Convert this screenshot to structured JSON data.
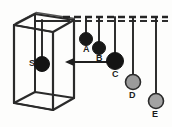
{
  "figure": {
    "background_color": "#fdfdfc",
    "stroke_color": "#232323",
    "width": 172,
    "height": 127
  },
  "rail": {
    "name": "support-rail",
    "style": "dashed",
    "y": 17,
    "x_start": 63,
    "x_end": 168,
    "color": "#252525"
  },
  "box": {
    "name": "wireframe-box",
    "color": "#2a2a2a",
    "description": "open wireframe rectangular box drawn in perspective"
  },
  "arrow": {
    "name": "direction-arrow",
    "direction": "left",
    "x_tail": 108,
    "x_head": 66,
    "y": 62,
    "color": "#1f1f1f"
  },
  "balls": [
    {
      "id": "S",
      "label": "S",
      "cx": 42,
      "cy": 64,
      "r": 7.5,
      "fill": "#141414",
      "stroke": "#141414",
      "string_top_y": 20,
      "label_x": 29,
      "label_y": 60,
      "location": "inside-box"
    },
    {
      "id": "A",
      "label": "A",
      "cx": 86,
      "cy": 39,
      "r": 6.5,
      "fill": "#181818",
      "stroke": "#181818",
      "string_top_y": 17,
      "label_x": 83,
      "label_y": 47,
      "location": "pendulum-row"
    },
    {
      "id": "B",
      "label": "B",
      "cx": 99,
      "cy": 48,
      "r": 6.5,
      "fill": "#181818",
      "stroke": "#181818",
      "string_top_y": 17,
      "label_x": 96,
      "label_y": 56,
      "location": "pendulum-row"
    },
    {
      "id": "C",
      "label": "C",
      "cx": 115,
      "cy": 61,
      "r": 8.5,
      "fill": "#141414",
      "stroke": "#141414",
      "string_top_y": 17,
      "label_x": 112,
      "label_y": 71,
      "location": "pendulum-row"
    },
    {
      "id": "D",
      "label": "D",
      "cx": 133,
      "cy": 82,
      "r": 7.5,
      "fill": "#9b9b9b",
      "stroke": "#2b2b2b",
      "string_top_y": 17,
      "label_x": 129,
      "label_y": 92,
      "location": "pendulum-row"
    },
    {
      "id": "E",
      "label": "E",
      "cx": 156,
      "cy": 101,
      "r": 7.5,
      "fill": "#a3a3a3",
      "stroke": "#2b2b2b",
      "string_top_y": 17,
      "label_x": 152,
      "label_y": 113,
      "location": "pendulum-row"
    }
  ]
}
